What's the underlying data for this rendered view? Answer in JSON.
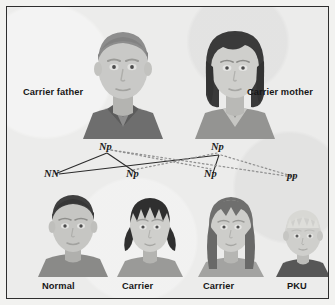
{
  "figure": {
    "kind": "pku-inheritance-pedigree",
    "background_color": "#ececeb",
    "border_color": "#2e2e2e"
  },
  "parents": [
    {
      "id": "father",
      "label": "Carrier father",
      "genotype": "Np",
      "hair_color": "#8d8d8d",
      "skin_color": "#c9c9c7",
      "shirt_color": "#6e6e6e"
    },
    {
      "id": "mother",
      "label": "Carrier mother",
      "genotype": "Np",
      "hair_color": "#3a3a3a",
      "skin_color": "#cfcfcc",
      "shirt_color": "#949492"
    }
  ],
  "offspring": [
    {
      "id": "child-1",
      "label": "Normal",
      "genotype": "NN",
      "hair_color": "#3f3f3f",
      "skin_color": "#c6c6c3",
      "shirt_color": "#8a8a88"
    },
    {
      "id": "child-2",
      "label": "Carrier",
      "genotype": "Np",
      "hair_color": "#2f2f2f",
      "skin_color": "#cfcfcc",
      "shirt_color": "#9a9a98"
    },
    {
      "id": "child-3",
      "label": "Carrier",
      "genotype": "Np",
      "hair_color": "#6f6f6e",
      "skin_color": "#cdcdca",
      "shirt_color": "#a3a3a1"
    },
    {
      "id": "child-4",
      "label": "PKU",
      "genotype": "pp",
      "hair_color": "#d8d8d4",
      "skin_color": "#cfcfcc",
      "shirt_color": "#575757"
    }
  ],
  "cross_lines": {
    "solid_color": "#2b2b2b",
    "dotted_color": "#8a8a8a",
    "from_father_solid_to": [
      "NN",
      "Np"
    ],
    "from_father_dotted_to": [
      "Np",
      "pp"
    ],
    "from_mother_solid_to": [
      "NN",
      "Np"
    ],
    "from_mother_dotted_to": [
      "Np",
      "pp"
    ]
  }
}
